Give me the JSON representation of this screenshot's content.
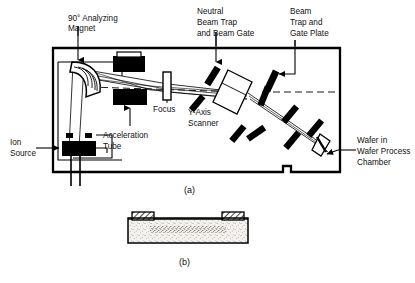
{
  "figure": {
    "panels": [
      {
        "id": "a",
        "caption": "(a)",
        "description": "Ion implanter beamline inside process chamber"
      },
      {
        "id": "b",
        "caption": "(b)",
        "description": "Cross-section of implanted wafer with masking layers"
      }
    ]
  },
  "colors": {
    "ink": "#000000",
    "background": "#ffffff",
    "substrate_fill": "#f2f0ec",
    "hatch": "#000000"
  },
  "labels": {
    "analyzing_magnet": {
      "lines": [
        "90° Analyzing",
        "Magnet"
      ]
    },
    "neutral_beam_trap": {
      "lines": [
        "Neutral",
        "Beam Trap",
        "and Beam Gate"
      ]
    },
    "beam_trap_gate_plate": {
      "lines": [
        "Beam",
        "Trap and",
        "Gate Plate"
      ]
    },
    "ion_source": {
      "lines": [
        "Ion",
        "Source"
      ]
    },
    "acceleration_tube": {
      "lines": [
        "Acceleration",
        "Tube"
      ]
    },
    "focus": {
      "lines": [
        "Focus"
      ]
    },
    "y_axis_scanner": {
      "lines": [
        "Y-Axis",
        "Scanner"
      ]
    },
    "wafer_process_chamber": {
      "lines": [
        "Wafer in",
        "Wafer Process",
        "Chamber"
      ]
    }
  },
  "captions": {
    "panel_a": "(a)",
    "panel_b": "(b)"
  }
}
